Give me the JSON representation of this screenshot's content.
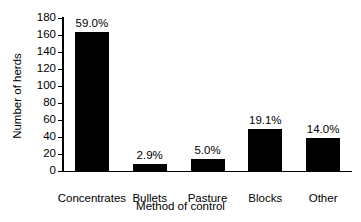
{
  "chart_data": {
    "type": "bar",
    "title": "",
    "xlabel": "Method of control",
    "ylabel": "Number of herds",
    "categories": [
      "Concentrates",
      "Bullets",
      "Pasture",
      "Blocks",
      "Other"
    ],
    "values": [
      164,
      8,
      14,
      50,
      39
    ],
    "data_labels": [
      "59.0%",
      "2.9%",
      "5.0%",
      "19.1%",
      "14.0%"
    ],
    "ylim": [
      0,
      180
    ],
    "yticks": [
      0,
      20,
      40,
      60,
      80,
      100,
      120,
      140,
      160,
      180
    ],
    "ytick_labels": [
      "0",
      "20",
      "40",
      "60",
      "80",
      "100",
      "120",
      "140",
      "160",
      "180"
    ],
    "grid": false,
    "legend": false,
    "bar_color": "#000000",
    "axis_color": "#000000",
    "background": "#ffffff"
  }
}
